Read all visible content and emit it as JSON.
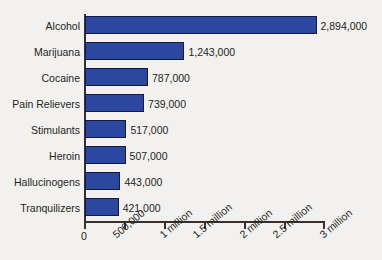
{
  "chart_data": {
    "type": "bar",
    "orientation": "horizontal",
    "title": "",
    "xlabel": "",
    "ylabel": "",
    "grid": false,
    "legend": false,
    "xlim": [
      0,
      3000000
    ],
    "categories": [
      "Alcohol",
      "Marijuana",
      "Cocaine",
      "Pain Relievers",
      "Stimulants",
      "Heroin",
      "Hallucinogens",
      "Tranquilizers"
    ],
    "values": [
      2894000,
      1243000,
      787000,
      739000,
      517000,
      507000,
      443000,
      421000
    ],
    "value_labels": [
      "2,894,000",
      "1,243,000",
      "787,000",
      "739,000",
      "517,000",
      "507,000",
      "443,000",
      "421,000"
    ],
    "xticks": [
      0,
      500000,
      1000000,
      1500000,
      2000000,
      2500000,
      3000000
    ],
    "xtick_labels": [
      "0",
      "500,000",
      "1 million",
      "1.5 million",
      "2 million",
      "2.5 million",
      "3 million"
    ],
    "bar_color": "#2b47a0",
    "bar_border_color": "#16184a",
    "axis_color": "#3a2f2c",
    "background_color": "#f2f1ef",
    "text_color": "#231f20"
  }
}
